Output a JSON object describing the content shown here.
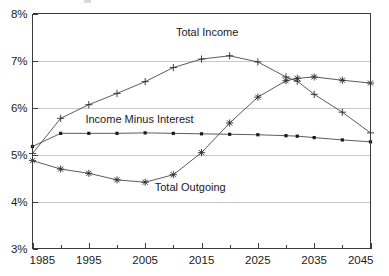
{
  "chart_data": {
    "type": "line",
    "title": "",
    "xlabel": "",
    "ylabel": "",
    "xlim": [
      1985,
      2045
    ],
    "ylim": [
      3,
      8
    ],
    "x_ticks_major": [
      1985,
      1995,
      2005,
      2015,
      2025,
      2035,
      2045
    ],
    "x_ticks_minor": [
      1990,
      2000,
      2010,
      2020,
      2030,
      2040
    ],
    "y_ticks": [
      3,
      4,
      5,
      6,
      7,
      8
    ],
    "y_tick_labels": [
      "3%",
      "4%",
      "5%",
      "6%",
      "7%",
      "8%"
    ],
    "x_tick_labels": [
      "1985",
      "1995",
      "2005",
      "2015",
      "2025",
      "2035",
      "2045"
    ],
    "grid": true,
    "grid_axis": "y",
    "legend": "inline-annotations",
    "x": [
      1985,
      1990,
      1995,
      2000,
      2005,
      2010,
      2015,
      2020,
      2025,
      2030,
      2032,
      2035,
      2040,
      2045
    ],
    "series": [
      {
        "name": "Total Income",
        "marker": "plus",
        "annotation": "Total Income",
        "values": [
          5.02,
          5.77,
          6.06,
          6.3,
          6.55,
          6.85,
          7.03,
          7.1,
          6.97,
          6.65,
          6.56,
          6.28,
          5.9,
          5.46
        ]
      },
      {
        "name": "Income Minus Interest",
        "marker": "square",
        "annotation": "Income Minus Interest",
        "values": [
          5.17,
          5.45,
          5.45,
          5.45,
          5.46,
          5.45,
          5.44,
          5.43,
          5.42,
          5.4,
          5.39,
          5.36,
          5.31,
          5.27
        ]
      },
      {
        "name": "Total Outgoing",
        "marker": "asterisk",
        "annotation": "Total Outgoing",
        "values": [
          4.87,
          4.69,
          4.6,
          4.46,
          4.41,
          4.57,
          5.04,
          5.67,
          6.22,
          6.57,
          6.62,
          6.65,
          6.58,
          6.52
        ]
      }
    ],
    "annotations": [
      {
        "text": "Total Income",
        "x": 2016,
        "y": 7.52
      },
      {
        "text": "Income Minus Interest",
        "x": 2004,
        "y": 5.68
      },
      {
        "text": "Total Outgoing",
        "x": 2013,
        "y": 4.22
      }
    ],
    "colors": {
      "line": "#4a4a4a",
      "marker": "#2b2b2b",
      "grid": "#c9c9c9",
      "axis": "#3a3a3a",
      "text": "#1a1a1a",
      "background": "#ffffff"
    }
  }
}
